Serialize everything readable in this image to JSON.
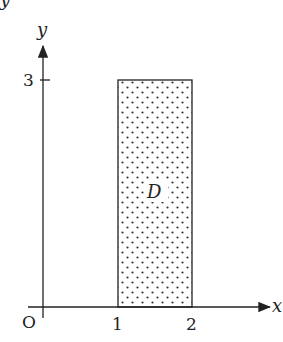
{
  "diagram": {
    "axes": {
      "x_label": "x",
      "y_label": "y",
      "origin_label": "O",
      "x_ticks": [
        "1",
        "2"
      ],
      "y_ticks": [
        "3"
      ]
    },
    "region": {
      "label": "D",
      "x_range": [
        1,
        2
      ],
      "y_range": [
        0,
        3
      ],
      "fill": "dotted"
    },
    "top_partial_label": "y"
  }
}
